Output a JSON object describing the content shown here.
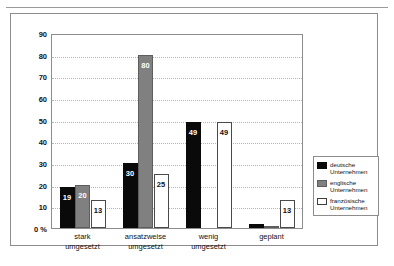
{
  "page": {
    "top_caption_ghost": "",
    "background_color": "#ffffff",
    "frame_border_color": "#8d8d8d"
  },
  "chart_data": {
    "type": "bar",
    "title": "",
    "subtitle": "",
    "xlabel": "",
    "ylabel": "",
    "ylim": [
      0,
      90
    ],
    "ytick_step": 10,
    "ytick_labels": [
      "0 %",
      "10",
      "20",
      "30",
      "40",
      "50",
      "60",
      "70",
      "80",
      "90"
    ],
    "ytick_values": [
      0,
      10,
      20,
      30,
      40,
      50,
      60,
      70,
      80,
      90
    ],
    "grid": true,
    "grid_style": "dotted-horizontal",
    "legend_position": "right",
    "categories": [
      "stark umgesetzt",
      "ansatzweise umgesetzt",
      "wenig umgesetzt",
      "geplant"
    ],
    "categories_lines": [
      [
        "stark",
        "umgesetzt"
      ],
      [
        "ansatzweise",
        "umgesetzt"
      ],
      [
        "wenig",
        "umgesetzt"
      ],
      [
        "geplant",
        ""
      ]
    ],
    "series": [
      {
        "name": "deutsche Unternehmen",
        "name_lines": [
          "deutsche",
          "Unternehmen"
        ],
        "color": "#0a0a0a",
        "style": "black",
        "values": [
          19,
          30,
          49,
          2
        ],
        "labels": [
          "19",
          "30",
          "49",
          ""
        ]
      },
      {
        "name": "englische Unternehmen",
        "name_lines": [
          "englische",
          "Unternehmen"
        ],
        "color": "#808080",
        "style": "gray",
        "values": [
          20,
          80,
          0,
          1
        ],
        "labels": [
          "20",
          "80",
          "",
          ""
        ]
      },
      {
        "name": "französische Unternehmen",
        "name_lines": [
          "französische",
          "Unternehmen"
        ],
        "color": "#ffffff",
        "style": "white",
        "values": [
          13,
          25,
          49,
          13
        ],
        "labels": [
          "13",
          "25",
          "49",
          "13"
        ]
      }
    ]
  }
}
